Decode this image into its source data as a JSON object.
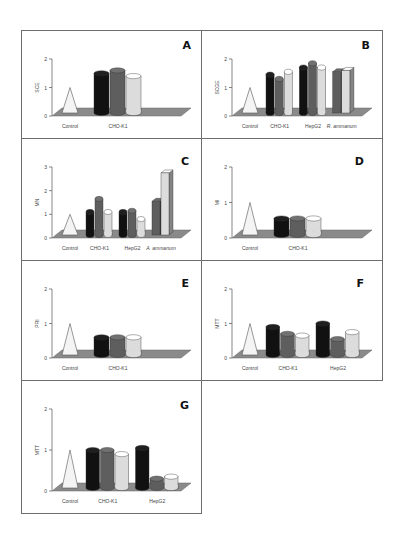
{
  "figure": {
    "colors": {
      "control": "#f4f4f4",
      "s1": "#111111",
      "s2": "#5e5e5e",
      "s3": "#dcdcdc",
      "floor": "#8a8a8a",
      "frame": "#6e6e6e",
      "axis": "#555555",
      "text": "#444444"
    }
  },
  "chart_data": [
    {
      "panel": "A",
      "type": "bar",
      "ylabel": "SCE",
      "ylim": [
        0,
        2
      ],
      "yticks": [
        0,
        1,
        2
      ],
      "categories": [
        "Control",
        "CHO-K1"
      ],
      "groups": [
        {
          "label": "Control",
          "control": true,
          "values": [
            1.0
          ]
        },
        {
          "label": "CHO-K1",
          "values": [
            1.5,
            1.6,
            1.4
          ]
        }
      ]
    },
    {
      "panel": "B",
      "type": "bar",
      "ylabel": "SCGE",
      "ylim": [
        0,
        2
      ],
      "yticks": [
        0,
        1,
        2
      ],
      "categories": [
        "Control",
        "CHO-K1",
        "HepG2",
        "R. ammanum"
      ],
      "groups": [
        {
          "label": "Control",
          "control": true,
          "values": [
            1.0
          ]
        },
        {
          "label": "CHO-K1",
          "values": [
            1.45,
            1.3,
            1.55
          ]
        },
        {
          "label": "HepG2",
          "values": [
            1.7,
            1.85,
            1.7
          ]
        },
        {
          "label": "R. ammanum",
          "values": [
            1.55,
            1.6
          ],
          "series_offset": 1,
          "prism": true
        }
      ]
    },
    {
      "panel": "C",
      "type": "bar",
      "ylabel": "MN",
      "ylim": [
        0,
        3
      ],
      "yticks": [
        0,
        1,
        2,
        3
      ],
      "categories": [
        "Control",
        "CHO-K1",
        "HepG2",
        "A. ammanum"
      ],
      "groups": [
        {
          "label": "Control",
          "control": true,
          "values": [
            1.0
          ]
        },
        {
          "label": "CHO-K1",
          "values": [
            1.1,
            1.65,
            1.1
          ]
        },
        {
          "label": "HepG2",
          "values": [
            1.1,
            1.15,
            0.8
          ]
        },
        {
          "label": "A. ammanum",
          "values": [
            1.55,
            2.75
          ],
          "series_offset": 1,
          "prism": true
        }
      ]
    },
    {
      "panel": "D",
      "type": "bar",
      "ylabel": "MI",
      "ylim": [
        0,
        2
      ],
      "yticks": [
        0,
        1,
        2
      ],
      "categories": [
        "Control",
        "CHO-K1"
      ],
      "groups": [
        {
          "label": "Control",
          "control": true,
          "values": [
            1.0
          ]
        },
        {
          "label": "CHO-K1",
          "values": [
            0.55,
            0.55,
            0.55
          ]
        }
      ]
    },
    {
      "panel": "E",
      "type": "bar",
      "ylabel": "PRI",
      "ylim": [
        0,
        2
      ],
      "yticks": [
        0,
        1,
        2
      ],
      "categories": [
        "Control",
        "CHO-K1"
      ],
      "groups": [
        {
          "label": "Control",
          "control": true,
          "values": [
            1.0
          ]
        },
        {
          "label": "CHO-K1",
          "values": [
            0.6,
            0.6,
            0.6
          ]
        }
      ]
    },
    {
      "panel": "F",
      "type": "bar",
      "ylabel": "MTT",
      "ylim": [
        0,
        2
      ],
      "yticks": [
        0,
        1,
        2
      ],
      "categories": [
        "Control",
        "CHO-K1",
        "HepG2"
      ],
      "groups": [
        {
          "label": "Control",
          "control": true,
          "values": [
            1.0
          ]
        },
        {
          "label": "CHO-K1",
          "values": [
            0.9,
            0.7,
            0.65
          ]
        },
        {
          "label": "HepG2",
          "values": [
            1.0,
            0.55,
            0.75
          ]
        }
      ]
    },
    {
      "panel": "G",
      "type": "bar",
      "ylabel": "MTT",
      "ylim": [
        0,
        2
      ],
      "yticks": [
        0,
        1,
        2
      ],
      "categories": [
        "Control",
        "CHO-K1",
        "HepG2"
      ],
      "groups": [
        {
          "label": "Control",
          "control": true,
          "values": [
            1.0
          ]
        },
        {
          "label": "CHO-K1",
          "values": [
            1.0,
            1.0,
            0.9
          ]
        },
        {
          "label": "HepG2",
          "values": [
            1.05,
            0.3,
            0.35
          ]
        }
      ]
    }
  ]
}
